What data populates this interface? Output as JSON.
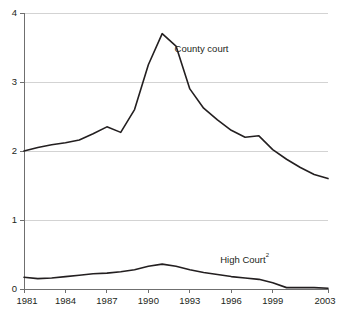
{
  "chart_data": {
    "type": "line",
    "title": "",
    "subtitle": "",
    "xlabel": "",
    "ylabel": "",
    "xlim": [
      1981,
      2003
    ],
    "ylim": [
      0,
      4
    ],
    "grid": true,
    "grid_axis": "y",
    "legend_position": "inline-annotation",
    "y_ticks": [
      "0",
      "1",
      "2",
      "3",
      "4"
    ],
    "y_tick_values": [
      0,
      1,
      2,
      3,
      4
    ],
    "x_ticks": [
      "1981",
      "1984",
      "1987",
      "1990",
      "1993",
      "1996",
      "1999",
      "2003"
    ],
    "x_tick_values": [
      1981,
      1984,
      1987,
      1990,
      1993,
      1996,
      1999,
      2003
    ],
    "x": [
      1981,
      1982,
      1983,
      1984,
      1985,
      1986,
      1987,
      1988,
      1989,
      1990,
      1991,
      1992,
      1993,
      1994,
      1995,
      1996,
      1997,
      1998,
      1999,
      2000,
      2001,
      2002,
      2003
    ],
    "series": [
      {
        "name": "County court",
        "label": "County court",
        "color": "#231f20",
        "values": [
          2.0,
          2.05,
          2.09,
          2.12,
          2.16,
          2.25,
          2.35,
          2.27,
          2.6,
          3.25,
          3.7,
          3.52,
          2.9,
          2.62,
          2.45,
          2.3,
          2.2,
          2.22,
          2.02,
          1.88,
          1.76,
          1.66,
          1.6
        ]
      },
      {
        "name": "High Court",
        "label": "High Court",
        "label_superscript": "2",
        "color": "#231f20",
        "values": [
          0.17,
          0.15,
          0.16,
          0.18,
          0.2,
          0.22,
          0.23,
          0.25,
          0.28,
          0.33,
          0.36,
          0.33,
          0.28,
          0.24,
          0.21,
          0.18,
          0.16,
          0.14,
          0.09,
          0.02,
          0.02,
          0.02,
          0.01
        ]
      }
    ],
    "annotations": [
      {
        "text": "County court",
        "x": 1991.9,
        "y": 3.43
      },
      {
        "text": "High Court",
        "superscript": "2",
        "x": 1995.2,
        "y": 0.37
      }
    ]
  }
}
